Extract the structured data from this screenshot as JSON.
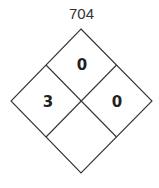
{
  "title": "704",
  "diamond": {
    "health": "3",
    "flammability": "0",
    "instability": "0",
    "special": ""
  },
  "colors": {
    "stroke": "#333333",
    "fill": "#ffffff"
  }
}
